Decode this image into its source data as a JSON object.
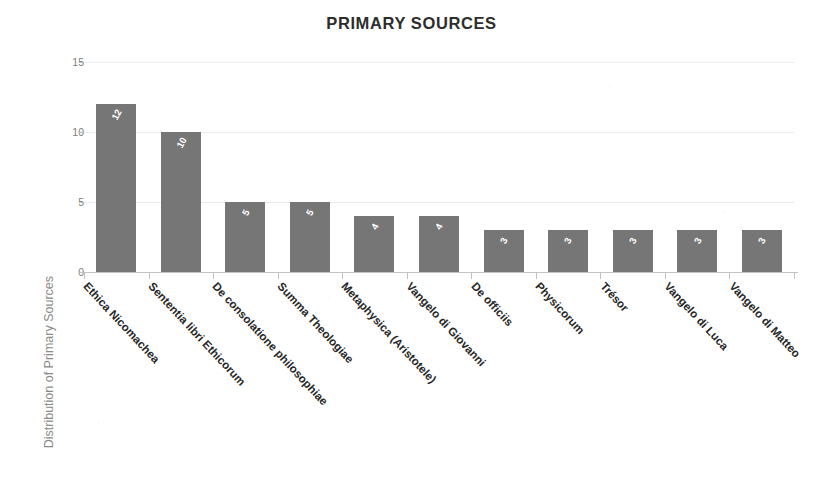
{
  "chart_data": {
    "type": "bar",
    "title": "PRIMARY SOURCES",
    "xlabel": "",
    "ylabel": "Distribution of Primary Sources",
    "ylim": [
      0,
      15
    ],
    "yticks": [
      0,
      5,
      10,
      15
    ],
    "grid": true,
    "legend": "none",
    "bar_color": "#767676",
    "value_labels_inside_bars": true,
    "categories": [
      "Ethica Nicomachea",
      "Sententia libri Ethicorum",
      "De consolatione philosophiae",
      "Summa Theologiae",
      "Metaphysica (Aristotele)",
      "Vangelo di Giovanni",
      "De officiis",
      "Physicorum",
      "Trésor",
      "Vangelo di Luca",
      "Vangelo di Matteo"
    ],
    "values": [
      12,
      10,
      5,
      5,
      4,
      4,
      3,
      3,
      3,
      3,
      3
    ]
  },
  "axis": {
    "ytick_labels": [
      "15",
      "10",
      "5",
      "0"
    ]
  }
}
